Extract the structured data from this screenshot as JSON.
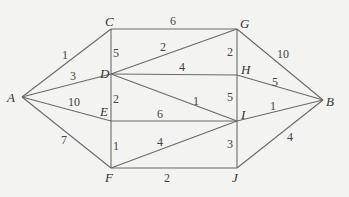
{
  "chart_data": {
    "type": "graph",
    "nodes": [
      {
        "id": "A",
        "x": 22,
        "y": 97,
        "lx": 7,
        "ly": 102
      },
      {
        "id": "B",
        "x": 323,
        "y": 100,
        "lx": 326,
        "ly": 106
      },
      {
        "id": "C",
        "x": 111,
        "y": 29,
        "lx": 105,
        "ly": 26
      },
      {
        "id": "D",
        "x": 111,
        "y": 74,
        "lx": 100,
        "ly": 78
      },
      {
        "id": "E",
        "x": 111,
        "y": 121,
        "lx": 100,
        "ly": 116
      },
      {
        "id": "F",
        "x": 111,
        "y": 168,
        "lx": 105,
        "ly": 182
      },
      {
        "id": "G",
        "x": 237,
        "y": 29,
        "lx": 240,
        "ly": 28
      },
      {
        "id": "H",
        "x": 237,
        "y": 75,
        "lx": 241,
        "ly": 74
      },
      {
        "id": "I",
        "x": 237,
        "y": 121,
        "lx": 241,
        "ly": 119
      },
      {
        "id": "J",
        "x": 237,
        "y": 168,
        "lx": 232,
        "ly": 182
      }
    ],
    "edges": [
      {
        "from": "A",
        "to": "C",
        "weight": "1",
        "lx": 62,
        "ly": 59
      },
      {
        "from": "A",
        "to": "D",
        "weight": "3",
        "lx": 70,
        "ly": 80
      },
      {
        "from": "A",
        "to": "E",
        "weight": "10",
        "lx": 68,
        "ly": 106
      },
      {
        "from": "A",
        "to": "F",
        "weight": "7",
        "lx": 61,
        "ly": 144
      },
      {
        "from": "C",
        "to": "G",
        "weight": "6",
        "lx": 170,
        "ly": 25
      },
      {
        "from": "C",
        "to": "D",
        "weight": "5",
        "lx": 113,
        "ly": 57
      },
      {
        "from": "D",
        "to": "G",
        "weight": "2",
        "lx": 160,
        "ly": 51
      },
      {
        "from": "D",
        "to": "H",
        "weight": "4",
        "lx": 179,
        "ly": 71
      },
      {
        "from": "D",
        "to": "I",
        "weight": "1",
        "lx": 193,
        "ly": 105
      },
      {
        "from": "D",
        "to": "E",
        "weight": "2",
        "lx": 113,
        "ly": 103
      },
      {
        "from": "E",
        "to": "I",
        "weight": "6",
        "lx": 157,
        "ly": 118
      },
      {
        "from": "E",
        "to": "F",
        "weight": "1",
        "lx": 113,
        "ly": 150
      },
      {
        "from": "F",
        "to": "I",
        "weight": "4",
        "lx": 157,
        "ly": 146
      },
      {
        "from": "F",
        "to": "J",
        "weight": "2",
        "lx": 164,
        "ly": 182
      },
      {
        "from": "G",
        "to": "H",
        "weight": "2",
        "lx": 227,
        "ly": 56
      },
      {
        "from": "H",
        "to": "I",
        "weight": "5",
        "lx": 227,
        "ly": 101
      },
      {
        "from": "I",
        "to": "J",
        "weight": "3",
        "lx": 227,
        "ly": 148
      },
      {
        "from": "G",
        "to": "B",
        "weight": "10",
        "lx": 277,
        "ly": 58
      },
      {
        "from": "H",
        "to": "B",
        "weight": "5",
        "lx": 272,
        "ly": 86
      },
      {
        "from": "I",
        "to": "B",
        "weight": "1",
        "lx": 270,
        "ly": 110
      },
      {
        "from": "J",
        "to": "B",
        "weight": "4",
        "lx": 287,
        "ly": 141
      }
    ]
  }
}
